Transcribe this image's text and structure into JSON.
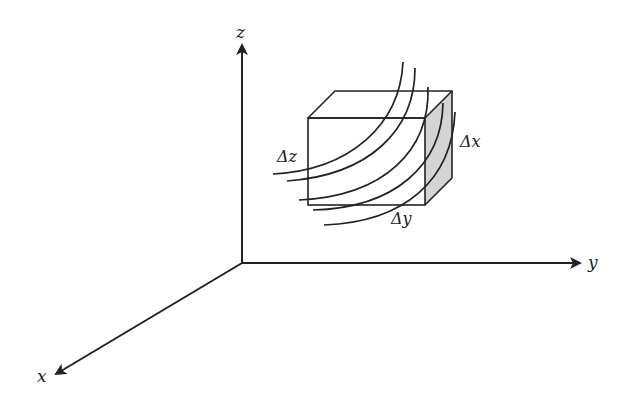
{
  "diagram": {
    "axes": {
      "x": {
        "label": "x"
      },
      "y": {
        "label": "y"
      },
      "z": {
        "label": "z"
      }
    },
    "element_labels": {
      "dx": "Δx",
      "dy": "Δy",
      "dz": "Δz"
    },
    "colors": {
      "stroke": "#222222",
      "shaded_face": "#d4d4d4",
      "background": "#ffffff"
    },
    "field_line_count": 5
  }
}
